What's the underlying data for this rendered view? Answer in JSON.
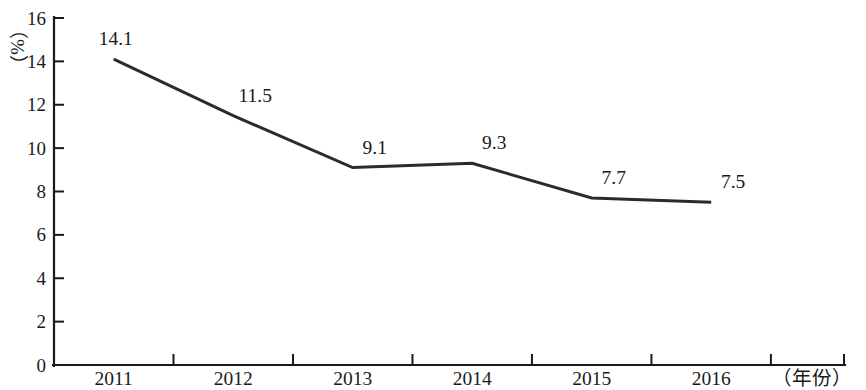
{
  "chart_data": {
    "type": "line",
    "title": "",
    "subtitle": "",
    "xlabel": "（年份）",
    "ylabel": "（%）",
    "y_unit_text": "（%）",
    "categories": [
      "2011",
      "2012",
      "2013",
      "2014",
      "2015",
      "2016"
    ],
    "values": [
      14.1,
      11.5,
      9.1,
      9.3,
      7.7,
      7.5
    ],
    "point_labels": [
      "14.1",
      "11.5",
      "9.1",
      "9.3",
      "7.7",
      "7.5"
    ],
    "series": [
      {
        "name": "",
        "values": [
          14.1,
          11.5,
          9.1,
          9.3,
          7.7,
          7.5
        ]
      }
    ],
    "ylim": [
      0,
      16
    ],
    "xlim": [
      0,
      6
    ],
    "y_ticks": [
      0,
      2,
      4,
      6,
      8,
      10,
      12,
      14,
      16
    ],
    "y_tick_labels": [
      "0",
      "2",
      "4",
      "6",
      "8",
      "10",
      "12",
      "14",
      "16"
    ],
    "x_tick_labels": [
      "2011",
      "2012",
      "2013",
      "2014",
      "2015",
      "2016"
    ],
    "grid": false,
    "legend": false,
    "legend_position": "none",
    "line_color": "#2b2b2b",
    "axis_color": "#1a1a1a",
    "background_color": "#ffffff",
    "markers": false
  },
  "axis": {
    "y_unit": "（%）",
    "x_title": "（年份）"
  }
}
